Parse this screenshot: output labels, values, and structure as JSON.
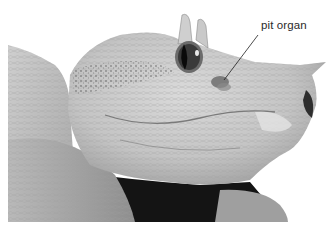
{
  "figure": {
    "annotation": {
      "label": "pit organ",
      "leader_line": {
        "x1": 258,
        "y1": 35,
        "x2": 224,
        "y2": 80
      }
    },
    "colors": {
      "background": "#ffffff",
      "skin_light": "#d2d2d2",
      "skin_mid": "#a8a8a8",
      "shadow": "#111111",
      "label_text": "#2a2a2a"
    }
  }
}
